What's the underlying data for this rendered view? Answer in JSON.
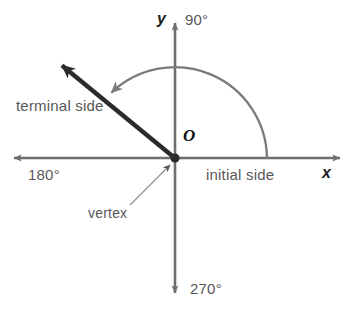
{
  "figure": {
    "type": "angle-in-standard-position-diagram",
    "colors": {
      "axis": "#6e6e70",
      "terminal_ray": "#2b2b2b",
      "arc": "#7a7a7c",
      "label_text": "#58585a",
      "axis_label_text": "#1d1d1d",
      "background": "#ffffff"
    },
    "geometry": {
      "origin": {
        "x": 175,
        "y": 158
      },
      "x_axis": {
        "left_tip_x": 8,
        "right_tip_x": 346,
        "y": 158
      },
      "y_axis": {
        "top_tip_y": 17,
        "bottom_tip_y": 299,
        "x": 175
      },
      "terminal_ray": {
        "tip_x": 52,
        "tip_y": 57,
        "angle_degrees": 140
      },
      "arc": {
        "radius": 92,
        "start_angle_degrees": 0,
        "end_angle_degrees": 142,
        "direction": "counterclockwise"
      },
      "vertex_leader": {
        "from_x": 133,
        "from_y": 203,
        "to_x": 172,
        "to_y": 163
      }
    }
  },
  "labels": {
    "y_axis": "y",
    "x_axis": "x",
    "origin": "O",
    "degree_90": "90°",
    "degree_180": "180°",
    "degree_270": "270°",
    "terminal_side": "terminal side",
    "initial_side": "initial side",
    "vertex": "vertex"
  }
}
